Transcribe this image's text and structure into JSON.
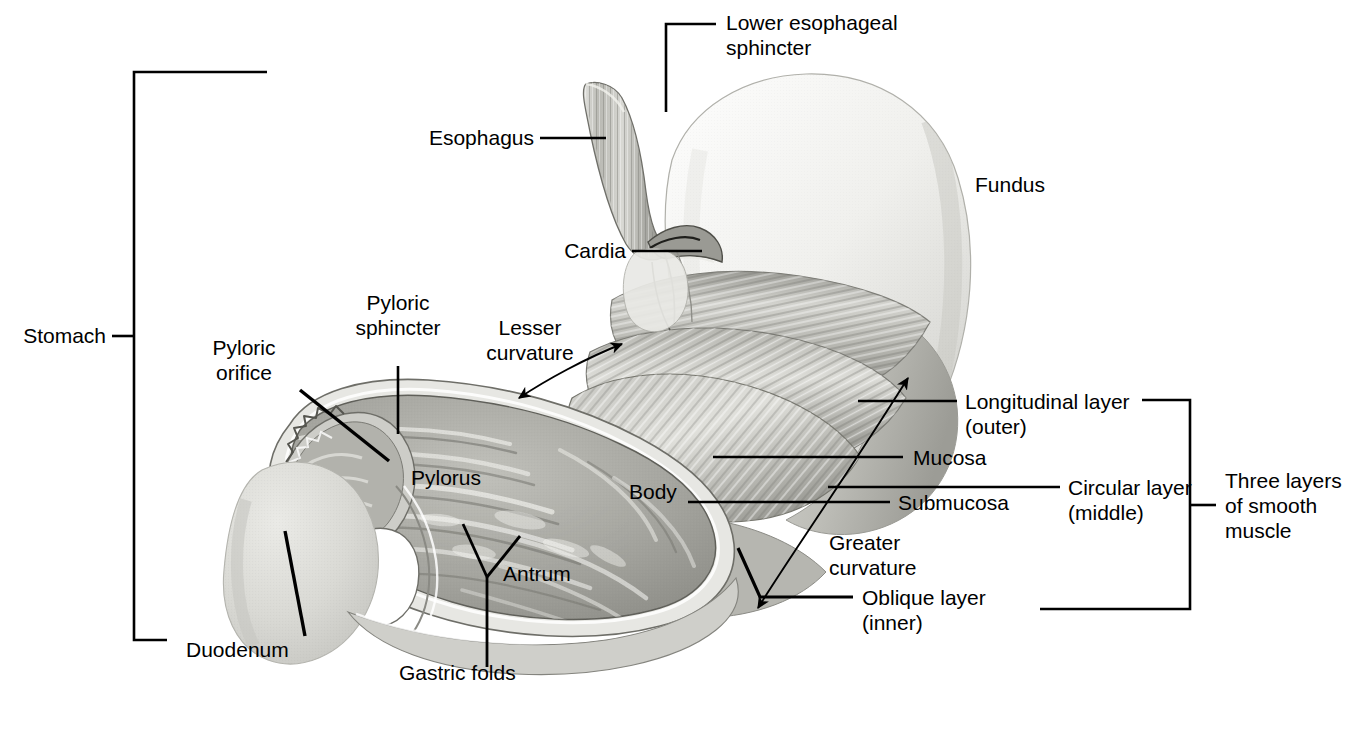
{
  "figure": {
    "type": "anatomical-illustration",
    "background_color": "#ffffff",
    "ink_color": "#000000"
  },
  "palette": {
    "fundus_fill": "#efefec",
    "fundus_shade": "#d6d6d2",
    "muscle_band": "#c2c2bd",
    "muscle_band_dark": "#9d9d98",
    "mucosa_fill": "#a8a8a3",
    "mucosa_light": "#d8d8d3",
    "duodenum_fill": "#dededa",
    "outline": "#5a5a57"
  },
  "labels": {
    "lower_esophageal_sphincter": "Lower esophageal\nsphincter",
    "esophagus": "Esophagus",
    "cardia": "Cardia",
    "fundus": "Fundus",
    "stomach": "Stomach",
    "pyloric_sphincter": "Pyloric\nsphincter",
    "pyloric_orifice": "Pyloric\norifice",
    "lesser_curvature": "Lesser\ncurvature",
    "pylorus": "Pylorus",
    "body": "Body",
    "antrum": "Antrum",
    "gastric_folds": "Gastric folds",
    "duodenum": "Duodenum",
    "greater_curvature": "Greater\ncurvature",
    "longitudinal_layer": "Longitudinal layer\n(outer)",
    "mucosa": "Mucosa",
    "submucosa": "Submucosa",
    "circular_layer": "Circular layer\n(middle)",
    "oblique_layer": "Oblique layer\n(inner)",
    "three_layers": "Three layers\nof smooth\nmuscle"
  },
  "brackets": {
    "stomach": {
      "label": "Stomach",
      "orientation": "left",
      "spans": [
        "Esophagus through Duodenum"
      ]
    },
    "three_layers_of_smooth_muscle": {
      "label": "Three layers of smooth muscle",
      "orientation": "right",
      "groups": [
        "Longitudinal layer (outer)",
        "Circular layer (middle)",
        "Oblique layer (inner)"
      ]
    }
  },
  "structures": [
    "Lower esophageal sphincter",
    "Esophagus",
    "Cardia",
    "Fundus",
    "Pyloric sphincter",
    "Pyloric orifice",
    "Lesser curvature",
    "Pylorus",
    "Body",
    "Antrum",
    "Gastric folds",
    "Duodenum",
    "Greater curvature",
    "Longitudinal layer (outer)",
    "Circular layer (middle)",
    "Oblique layer (inner)",
    "Mucosa",
    "Submucosa"
  ]
}
